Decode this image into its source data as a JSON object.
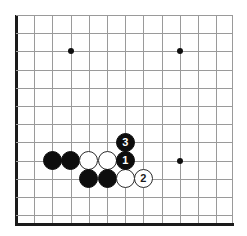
{
  "figure": {
    "kind": "go-board-diagram",
    "width": 247,
    "height": 236,
    "background_color": "#ffffff"
  },
  "board": {
    "grid_color": "#9a9a9a",
    "edge_color": "#1a1a1a",
    "spacing_px": 18.2,
    "origin_x": 16,
    "origin_y": 15,
    "columns_x": [
      16,
      34.2,
      52.4,
      70.6,
      88.8,
      107,
      125.2,
      143.4,
      161.6,
      179.8,
      198,
      216.2,
      232
    ],
    "rows_y": [
      15,
      33.2,
      51.4,
      69.6,
      87.8,
      106,
      124.2,
      142.4,
      160.6,
      178.8,
      197,
      215.2,
      223
    ],
    "left_edge_x": 16,
    "bottom_edge_y": 223,
    "right_crop_x": 232,
    "top_crop_y": 15
  },
  "star_points": [
    {
      "name": "star-point-upper-left",
      "x": 70.6,
      "y": 51.4
    },
    {
      "name": "star-point-upper-right",
      "x": 179.8,
      "y": 51.4
    },
    {
      "name": "star-point-lower-right",
      "x": 179.8,
      "y": 160.6
    }
  ],
  "stones": [
    {
      "id": "black-stone-a",
      "color": "black",
      "label": "",
      "x": 52.4,
      "y": 160.6
    },
    {
      "id": "black-stone-b",
      "color": "black",
      "label": "",
      "x": 70.6,
      "y": 160.6
    },
    {
      "id": "white-stone-a",
      "color": "white",
      "label": "",
      "x": 88.8,
      "y": 160.6
    },
    {
      "id": "white-stone-b",
      "color": "white",
      "label": "",
      "x": 107,
      "y": 160.6
    },
    {
      "id": "black-move-1",
      "color": "black",
      "label": "1",
      "x": 125.2,
      "y": 160.6
    },
    {
      "id": "black-move-3",
      "color": "black",
      "label": "3",
      "x": 125.2,
      "y": 142.4
    },
    {
      "id": "black-stone-c",
      "color": "black",
      "label": "",
      "x": 88.8,
      "y": 178.8
    },
    {
      "id": "black-stone-d",
      "color": "black",
      "label": "",
      "x": 107,
      "y": 178.8
    },
    {
      "id": "white-stone-c",
      "color": "white",
      "label": "",
      "x": 125.2,
      "y": 178.8
    },
    {
      "id": "white-move-2",
      "color": "white",
      "label": "2",
      "x": 143.4,
      "y": 178.8
    }
  ],
  "move_sequence": [
    {
      "number": "1",
      "color": "black"
    },
    {
      "number": "2",
      "color": "white"
    },
    {
      "number": "3",
      "color": "black"
    }
  ]
}
